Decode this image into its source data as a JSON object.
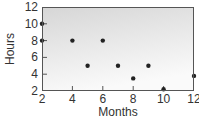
{
  "chart_data": {
    "type": "scatter",
    "title": "",
    "xlabel": "Months",
    "ylabel": "Hours",
    "xlim": [
      2,
      12
    ],
    "ylim": [
      2,
      12
    ],
    "x_ticks": [
      2,
      4,
      6,
      8,
      10,
      12
    ],
    "y_ticks": [
      2,
      4,
      6,
      8,
      10,
      12
    ],
    "grid": false,
    "legend": "none",
    "points": [
      {
        "x": 2,
        "y": 10
      },
      {
        "x": 2,
        "y": 8
      },
      {
        "x": 4,
        "y": 8
      },
      {
        "x": 5,
        "y": 5
      },
      {
        "x": 6,
        "y": 8
      },
      {
        "x": 7,
        "y": 5
      },
      {
        "x": 8,
        "y": 3.5
      },
      {
        "x": 9,
        "y": 5
      },
      {
        "x": 10,
        "y": 2.2
      },
      {
        "x": 12,
        "y": 3.8
      }
    ],
    "colors": {
      "point": "#222222",
      "frame": "#555555",
      "background_top": "#d6d6d6",
      "background_bottom": "#fafafa"
    }
  }
}
